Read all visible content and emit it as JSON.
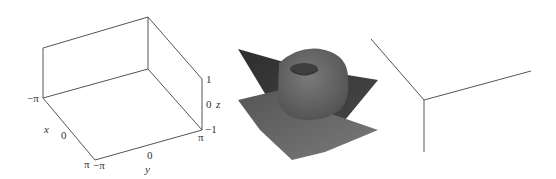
{
  "figure": {
    "panels": [
      {
        "name": "axes-box",
        "axis_labels": {
          "x": "x",
          "y": "y",
          "z": "z"
        },
        "x_ticks": [
          "−π",
          "0",
          "π"
        ],
        "y_ticks": [
          "−π",
          "0",
          "π"
        ],
        "z_ticks": [
          "1",
          "0",
          "−1"
        ]
      },
      {
        "name": "surface-plot",
        "description": "3D surface: a dome with a dimple on top intersecting a twisted saddle-like sheet",
        "colors": {
          "surface_dark": "#3a3a3a",
          "surface_mid": "#5a5a5a",
          "dome": "#6a6a6a"
        }
      },
      {
        "name": "axes-corner",
        "description": "three axis lines meeting at a corner"
      }
    ]
  }
}
